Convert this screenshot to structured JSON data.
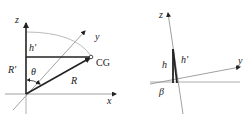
{
  "left_diagram": {
    "axes": {
      "z": "z",
      "x": "x",
      "y": "y"
    },
    "labels": {
      "h_prime": "h'",
      "r_prime": "R'",
      "theta": "θ",
      "r": "R",
      "cg": "CG"
    }
  },
  "right_diagram": {
    "axes": {
      "z": "z",
      "y": "y"
    },
    "labels": {
      "h": "h",
      "h_prime": "h'",
      "beta": "β"
    }
  },
  "colors": {
    "line": "#222222",
    "light_line": "#999999",
    "arc": "#aaaaaa"
  }
}
